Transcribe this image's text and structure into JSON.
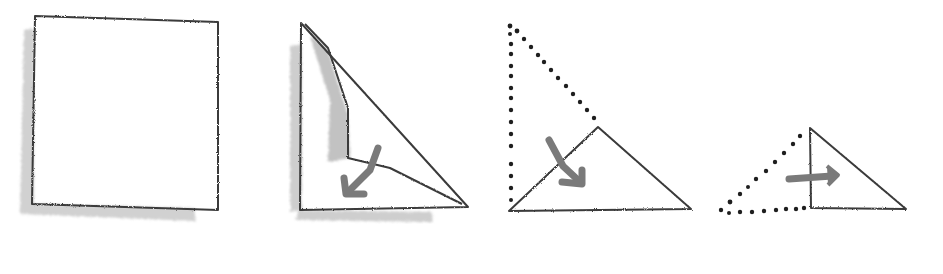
{
  "diagram": {
    "type": "origami-folding-steps",
    "colors": {
      "background": "#ffffff",
      "line": "#3a3a3a",
      "shadow": "#c4c4c4",
      "arrow": "#7a7a7a",
      "dots": "#1e1e1e"
    },
    "steps": [
      {
        "index": 1,
        "shape": "square",
        "description": "square sheet of paper"
      },
      {
        "index": 2,
        "shape": "square-folding-diagonal",
        "description": "fold corner down along diagonal",
        "arrow": "down-left"
      },
      {
        "index": 3,
        "shape": "triangle",
        "description": "fold top corner down to bottom edge",
        "arrow": "down-right"
      },
      {
        "index": 4,
        "shape": "small-triangle",
        "description": "fold left part over to the right",
        "arrow": "right"
      }
    ]
  }
}
